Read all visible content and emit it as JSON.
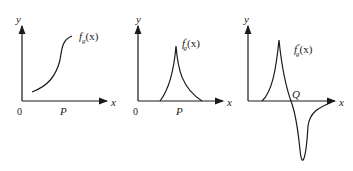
{
  "panels": [
    {
      "id": "panel-1",
      "function_label": "f_g(x)",
      "func_main": "f",
      "func_sub": "g",
      "func_arg": "(x)",
      "func_prime": "",
      "y_axis": "y",
      "x_axis": "x",
      "origin": "0",
      "point_label": "P"
    },
    {
      "id": "panel-2",
      "function_label": "f'_g(x)",
      "func_main": "f",
      "func_sub": "g",
      "func_arg": "(x)",
      "func_prime": "′",
      "y_axis": "y",
      "x_axis": "x",
      "origin": "0",
      "point_label": "P"
    },
    {
      "id": "panel-3",
      "function_label": "f''_g(x)",
      "func_main": "f",
      "func_sub": "g",
      "func_arg": "(x)",
      "func_prime": "″",
      "y_axis": "y",
      "x_axis": "x",
      "point_label": "Q"
    }
  ],
  "colors": {
    "stroke": "#1a1a1a",
    "background": "#ffffff"
  }
}
